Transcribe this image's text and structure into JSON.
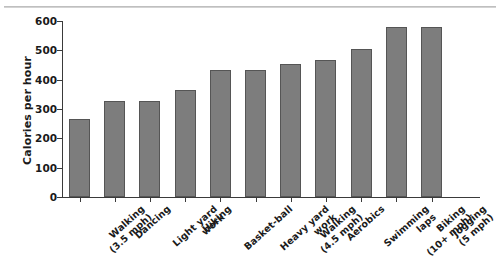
{
  "chart_data": {
    "type": "bar",
    "title": "",
    "subtitle": "",
    "xlabel": "",
    "ylabel": "Calories per hour",
    "ylim": [
      0,
      600
    ],
    "yticks": [
      0,
      100,
      200,
      300,
      400,
      500,
      600
    ],
    "ytick_labels": [
      "0",
      "100",
      "200",
      "300",
      "400",
      "500",
      "600"
    ],
    "grid": false,
    "legend": null,
    "bar_color": "#7d7d7d",
    "bar_edge_color": "#555555",
    "axis_color": "#3a3a3a",
    "categories": [
      "Walking\n(3.5 mph)",
      "Dancing",
      "Light yard\nwork",
      "Hiking",
      "Basket-ball",
      "Heavy yard\nwork",
      "Walking\n(4.5 mph)",
      "Aerobics",
      "Swimming\nlaps",
      "Biking\n(10+ mph)",
      "Jogging\n(5 mph)"
    ],
    "values": [
      265,
      328,
      328,
      365,
      433,
      433,
      455,
      468,
      503,
      580,
      580
    ]
  }
}
